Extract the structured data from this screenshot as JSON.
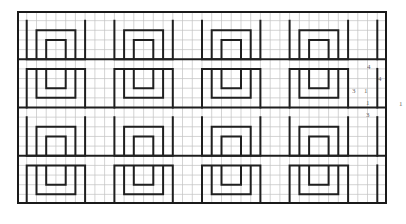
{
  "figure": {
    "type": "line-drawing",
    "grid": {
      "visible": true,
      "columns": 38,
      "rows": 20,
      "cell_size_px": 9.73,
      "line_color": "#b9b9b9",
      "major_line_color": "#9a9a9a",
      "background_color": "#ffffff"
    },
    "border": {
      "color": "#1a1a1a",
      "width_px": 2
    },
    "pattern": {
      "stroke_color": "#1f1f1f",
      "stroke_width_px": 2,
      "motif": "greek-key-spiral",
      "motif_cells_wide": 9,
      "motif_cells_tall": 5,
      "bands": 4,
      "motifs_per_band": 4
    }
  },
  "annotations": {
    "a": "4",
    "b": "4",
    "c": "3",
    "d": "1",
    "e": "1",
    "f": "3",
    "g": "1"
  }
}
